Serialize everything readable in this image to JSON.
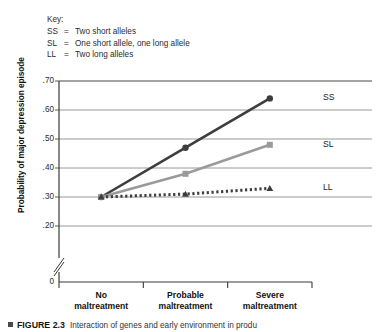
{
  "key": {
    "title": "Key:",
    "entries": [
      {
        "code": "SS",
        "eq": "=",
        "label": "Two short alleles"
      },
      {
        "code": "SL",
        "eq": "=",
        "label": "One short allele, one long allele"
      },
      {
        "code": "LL",
        "eq": "=",
        "label": "Two long alleles"
      }
    ]
  },
  "caption": {
    "figure_number": "FIGURE 2.3",
    "text": "Interaction of genes and early environment in produ"
  },
  "chart_data": {
    "type": "line",
    "title": "",
    "xlabel": "",
    "ylabel": "Probability of major depression episode",
    "categories": [
      "No maltreatment",
      "Probable maltreatment",
      "Severe maltreatment"
    ],
    "ylim": [
      0,
      0.7
    ],
    "ytick_labels": [
      ".70",
      ".60",
      ".50",
      ".40",
      ".30",
      ".20",
      "0"
    ],
    "ytick_values": [
      0.7,
      0.6,
      0.5,
      0.4,
      0.3,
      0.2,
      0.0
    ],
    "axis_break": true,
    "grid": true,
    "legend_position": "right-inline",
    "series": [
      {
        "name": "SS",
        "values": [
          0.3,
          0.47,
          0.64
        ],
        "color": "#3d3d3d",
        "style": "solid",
        "marker": "circle"
      },
      {
        "name": "SL",
        "values": [
          0.3,
          0.38,
          0.48
        ],
        "color": "#9a9a9a",
        "style": "solid",
        "marker": "square"
      },
      {
        "name": "LL",
        "values": [
          0.3,
          0.31,
          0.33
        ],
        "color": "#3d3d3d",
        "style": "dotted",
        "marker": "triangle"
      }
    ]
  }
}
